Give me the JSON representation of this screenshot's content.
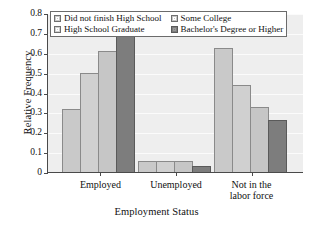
{
  "chart_data": {
    "type": "bar",
    "title": "",
    "xlabel": "Employment Status",
    "ylabel": "Relative Frequency",
    "categories": [
      "Employed",
      "Unemployed",
      "Not in the\nlabor force"
    ],
    "category_labels": [
      [
        "Employed"
      ],
      [
        "Unemployed"
      ],
      [
        "Not in the",
        "labor force"
      ]
    ],
    "series": [
      {
        "name": "Did not finish High School",
        "color": "#c9c9c9",
        "values": [
          0.315,
          0.055,
          0.625
        ]
      },
      {
        "name": "High School Graduate",
        "color": "#d0d0d0",
        "values": [
          0.5,
          0.055,
          0.44
        ]
      },
      {
        "name": "Some College",
        "color": "#c6c6c6",
        "values": [
          0.61,
          0.055,
          0.325
        ]
      },
      {
        "name": "Bachelor's Degree or Higher",
        "color": "#7d7d7d",
        "values": [
          0.705,
          0.03,
          0.26
        ]
      }
    ],
    "ylim": [
      0,
      0.8
    ],
    "ytick_values": [
      0,
      0.1,
      0.2,
      0.3,
      0.4,
      0.5,
      0.6,
      0.7,
      0.8
    ],
    "ytick_labels": [
      "0",
      "0.1",
      "0.2",
      "0.3",
      "0.4",
      "0.5",
      "0.6",
      "0.7",
      "0.8"
    ],
    "grid": true,
    "grid_axis": "y",
    "legend_position": "upper-center",
    "legend_columns": 2,
    "plot_background": "#eeeeee",
    "axis_color": "#4a4a4a"
  },
  "legend": {
    "columns": [
      [
        "Did not finish High School",
        "High School Graduate"
      ],
      [
        "Some College",
        "Bachelor's Degree or Higher"
      ]
    ]
  }
}
